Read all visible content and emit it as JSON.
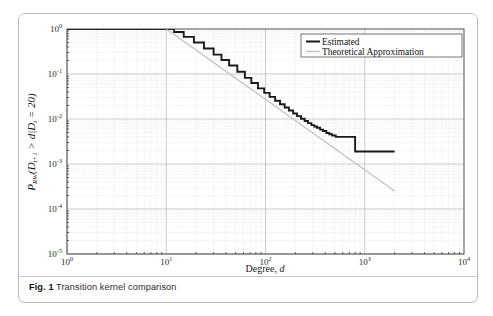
{
  "figure": {
    "caption_label": "Fig. 1",
    "caption_text": "Transition kernel comparison"
  },
  "chart_data": {
    "type": "line",
    "title": "",
    "xlabel": "Degree, d",
    "ylabel": "P_RW(D_t+1 > d | D_t = 20)",
    "xscale": "log",
    "yscale": "log",
    "xlim": [
      1,
      10000
    ],
    "ylim": [
      1e-05,
      1
    ],
    "grid": true,
    "grid_minor": true,
    "legend_position": "top-right",
    "xticks": [
      1,
      10,
      100,
      1000,
      10000
    ],
    "xtick_labels": [
      "10^0",
      "10^1",
      "10^2",
      "10^3",
      "10^4"
    ],
    "yticks": [
      1,
      0.1,
      0.01,
      0.001,
      0.0001,
      1e-05
    ],
    "ytick_labels": [
      "10^0",
      "10^-1",
      "10^-2",
      "10^-3",
      "10^-4",
      "10^-5"
    ],
    "series": [
      {
        "name": "Estimated",
        "color": "#1a1a1a",
        "style": "step",
        "width": 1.9,
        "x": [
          1,
          10,
          12,
          15,
          19,
          24,
          30,
          36,
          43,
          52,
          62,
          72,
          84,
          97,
          110,
          125,
          140,
          156,
          172,
          190,
          208,
          228,
          248,
          268,
          290,
          310,
          330,
          355,
          380,
          410,
          440,
          470,
          510,
          560,
          620,
          700,
          800,
          900,
          1000,
          2000
        ],
        "y": [
          1.0,
          1.0,
          0.86,
          0.67,
          0.5,
          0.37,
          0.27,
          0.205,
          0.155,
          0.112,
          0.082,
          0.063,
          0.048,
          0.038,
          0.031,
          0.0255,
          0.0212,
          0.018,
          0.0155,
          0.0133,
          0.0116,
          0.0101,
          0.009,
          0.0081,
          0.0073,
          0.0068,
          0.0064,
          0.0058,
          0.0054,
          0.0049,
          0.0046,
          0.0043,
          0.004,
          0.004,
          0.004,
          0.004,
          0.0019,
          0.0019,
          0.0019,
          0.0019
        ]
      },
      {
        "name": "Theoretical Approximation",
        "color": "#c2c2c2",
        "style": "line",
        "width": 1.3,
        "x": [
          10,
          2000
        ],
        "y": [
          1.0,
          0.00025
        ]
      }
    ]
  },
  "legend": {
    "entries": [
      {
        "label": "Estimated",
        "color": "#1a1a1a"
      },
      {
        "label": "Theoretical Approximation",
        "color": "#c2c2c2"
      }
    ]
  },
  "ylabel_parts": {
    "p": "P",
    "p_sub": "RW",
    "open": "(",
    "d1": "D",
    "d1_sub": "t+1",
    "gt": " > ",
    "d_it": "d",
    "bar": "|",
    "d2": "D",
    "d2_sub": "t",
    "eq": " = 20)"
  },
  "xlabel_parts": {
    "text": "Degree, ",
    "italic": "d"
  }
}
